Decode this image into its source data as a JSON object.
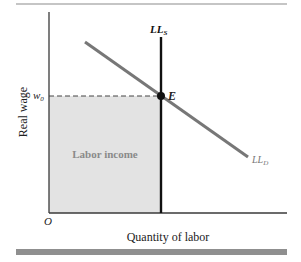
{
  "diagram": {
    "y_axis_label": "Real wage",
    "x_axis_label": "Quantity of labor",
    "origin_label": "O",
    "wage_tick_label": "w",
    "wage_tick_subscript": "0",
    "equilibrium_label": "E",
    "supply_curve": {
      "label": "LL",
      "subscript": "S"
    },
    "demand_curve": {
      "label": "LL",
      "subscript": "D"
    },
    "shaded_region_label": "Labor income",
    "colors": {
      "axis": "#3a3a3a",
      "supply_line": "#111111",
      "demand_line": "#777777",
      "shaded_fill": "#e3e3e3",
      "shaded_text": "#8a8a8a",
      "rule_top": "#8c8c8c",
      "rule_bottom": "#8f8f8f"
    }
  }
}
